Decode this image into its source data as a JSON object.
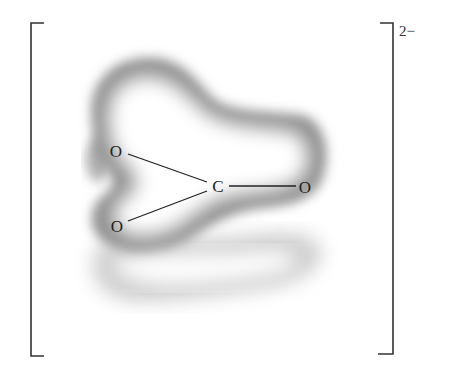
{
  "diagram": {
    "charge": "2−",
    "atoms": [
      {
        "id": "o-top",
        "label": "O",
        "x": 116,
        "y": 151
      },
      {
        "id": "c-center",
        "label": "C",
        "x": 218,
        "y": 186
      },
      {
        "id": "o-right",
        "label": "O",
        "x": 305,
        "y": 187
      },
      {
        "id": "o-bottom",
        "label": "O",
        "x": 117,
        "y": 226
      }
    ],
    "bonds": [
      {
        "from": "c-center",
        "to": "o-top"
      },
      {
        "from": "c-center",
        "to": "o-right"
      },
      {
        "from": "c-center",
        "to": "o-bottom"
      }
    ],
    "colors": {
      "bracket": "#333333",
      "bond": "#222222",
      "cloud_dark": "#8a8a8a",
      "cloud_light": "#ffffff"
    }
  }
}
